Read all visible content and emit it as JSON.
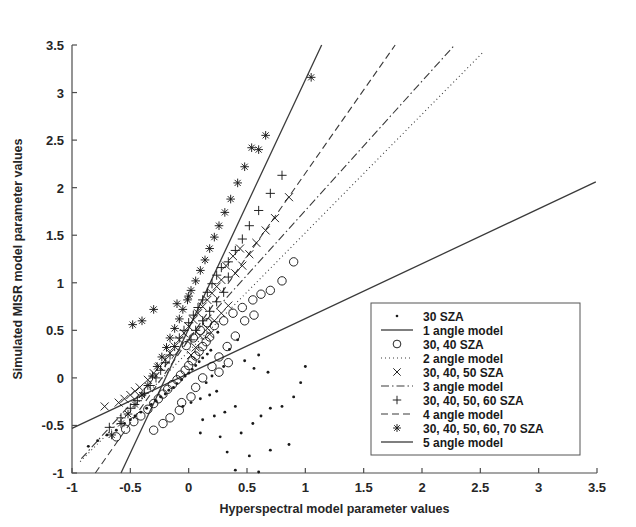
{
  "figure": {
    "kind": "scatter-plot",
    "background": "#ffffff",
    "ink_color": "#1a1a1a"
  },
  "chart_data": {
    "type": "scatter",
    "title": "",
    "xlabel": "Hyperspectral model parameter values",
    "ylabel": "Simulated MISR model parameter values",
    "xlim": [
      -1,
      3.5
    ],
    "ylim": [
      -1,
      3.5
    ],
    "xticks": [
      -1,
      -0.5,
      0,
      0.5,
      1,
      1.5,
      2,
      2.5,
      3,
      3.5
    ],
    "yticks": [
      -1,
      -0.5,
      0,
      0.5,
      1,
      1.5,
      2,
      2.5,
      3,
      3.5
    ],
    "xticklabels": [
      "-1",
      "-0.5",
      "0",
      "0.5",
      "1",
      "1.5",
      "2",
      "2.5",
      "3",
      "3.5"
    ],
    "yticklabels": [
      "-1",
      "-0.5",
      "0",
      "0.5",
      "1",
      "1.5",
      "2",
      "2.5",
      "3",
      "3.5"
    ],
    "grid": false,
    "legend_position": "lower right",
    "series": [
      {
        "name": "30 SZA",
        "marker": "dot",
        "points": [
          [
            -0.86,
            -0.72
          ],
          [
            -0.78,
            -0.66
          ],
          [
            -0.7,
            -0.6
          ],
          [
            -0.62,
            -0.55
          ],
          [
            -0.55,
            -0.48
          ],
          [
            -0.5,
            -0.44
          ],
          [
            -0.46,
            -0.4
          ],
          [
            -0.41,
            -0.36
          ],
          [
            -0.36,
            -0.32
          ],
          [
            -0.32,
            -0.28
          ],
          [
            -0.28,
            -0.24
          ],
          [
            -0.24,
            -0.2
          ],
          [
            -0.2,
            -0.17
          ],
          [
            -0.17,
            -0.13
          ],
          [
            -0.13,
            -0.1
          ],
          [
            -0.1,
            -0.06
          ],
          [
            -0.06,
            -0.02
          ],
          [
            -0.03,
            0.02
          ],
          [
            0.0,
            0.05
          ],
          [
            0.03,
            0.09
          ],
          [
            0.06,
            0.13
          ],
          [
            0.09,
            0.17
          ],
          [
            0.12,
            0.21
          ],
          [
            0.16,
            0.25
          ],
          [
            0.19,
            0.29
          ],
          [
            -0.05,
            -0.3
          ],
          [
            0.02,
            -0.26
          ],
          [
            0.1,
            -0.22
          ],
          [
            0.18,
            -0.18
          ],
          [
            0.24,
            -0.14
          ],
          [
            0.12,
            -0.44
          ],
          [
            0.22,
            -0.4
          ],
          [
            0.31,
            -0.36
          ],
          [
            0.4,
            -0.3
          ],
          [
            0.1,
            -0.58
          ],
          [
            0.27,
            -0.62
          ],
          [
            0.45,
            -0.58
          ],
          [
            0.55,
            -0.48
          ],
          [
            0.62,
            -0.4
          ],
          [
            0.7,
            -0.32
          ],
          [
            0.33,
            -0.78
          ],
          [
            0.52,
            -0.82
          ],
          [
            0.7,
            -0.76
          ],
          [
            0.86,
            -0.7
          ],
          [
            0.4,
            -0.97
          ],
          [
            0.6,
            -0.99
          ],
          [
            0.8,
            -0.3
          ],
          [
            0.9,
            -0.2
          ],
          [
            1.0,
            0.12
          ],
          [
            0.96,
            -0.05
          ],
          [
            0.48,
            0.18
          ],
          [
            0.56,
            0.1
          ],
          [
            0.35,
            0.3
          ],
          [
            0.42,
            0.4
          ],
          [
            0.25,
            0.48
          ],
          [
            0.3,
            0.12
          ],
          [
            0.2,
            0.02
          ],
          [
            0.15,
            -0.05
          ],
          [
            0.6,
            0.24
          ],
          [
            0.68,
            0.06
          ]
        ]
      },
      {
        "name": "30, 40 SZA",
        "marker": "circle",
        "points": [
          [
            -0.62,
            -0.62
          ],
          [
            -0.54,
            -0.54
          ],
          [
            -0.47,
            -0.46
          ],
          [
            -0.41,
            -0.4
          ],
          [
            -0.35,
            -0.33
          ],
          [
            -0.3,
            -0.27
          ],
          [
            -0.26,
            -0.22
          ],
          [
            -0.22,
            -0.17
          ],
          [
            -0.18,
            -0.12
          ],
          [
            -0.14,
            -0.07
          ],
          [
            -0.1,
            -0.02
          ],
          [
            -0.07,
            0.03
          ],
          [
            -0.03,
            0.08
          ],
          [
            0.0,
            0.13
          ],
          [
            0.03,
            0.18
          ],
          [
            0.06,
            0.23
          ],
          [
            0.09,
            0.28
          ],
          [
            0.12,
            0.33
          ],
          [
            0.15,
            0.38
          ],
          [
            0.18,
            0.43
          ],
          [
            -0.3,
            -0.55
          ],
          [
            -0.22,
            -0.48
          ],
          [
            -0.16,
            -0.42
          ],
          [
            -0.08,
            -0.34
          ],
          [
            0.06,
            -0.1
          ],
          [
            0.12,
            0.0
          ],
          [
            0.2,
            0.12
          ],
          [
            0.26,
            0.22
          ],
          [
            0.33,
            0.33
          ],
          [
            0.4,
            0.44
          ],
          [
            0.22,
            0.55
          ],
          [
            0.3,
            0.6
          ],
          [
            0.38,
            0.68
          ],
          [
            0.46,
            0.74
          ],
          [
            0.55,
            0.82
          ],
          [
            0.62,
            0.88
          ],
          [
            0.48,
            0.6
          ],
          [
            0.56,
            0.66
          ],
          [
            0.16,
            0.58
          ],
          [
            0.1,
            0.5
          ],
          [
            0.04,
            0.42
          ],
          [
            -0.02,
            0.34
          ],
          [
            0.7,
            0.92
          ],
          [
            0.8,
            1.02
          ],
          [
            0.9,
            1.22
          ],
          [
            0.34,
            0.16
          ],
          [
            0.26,
            0.06
          ],
          [
            0.02,
            -0.2
          ],
          [
            -0.06,
            -0.26
          ]
        ]
      },
      {
        "name": "30, 40, 50 SZA",
        "marker": "x",
        "points": [
          [
            -0.72,
            -0.3
          ],
          [
            -0.6,
            -0.26
          ],
          [
            -0.5,
            -0.18
          ],
          [
            -0.42,
            -0.1
          ],
          [
            -0.35,
            -0.02
          ],
          [
            -0.3,
            0.05
          ],
          [
            -0.25,
            0.12
          ],
          [
            -0.2,
            0.19
          ],
          [
            -0.16,
            0.26
          ],
          [
            -0.12,
            0.33
          ],
          [
            -0.08,
            0.4
          ],
          [
            -0.04,
            0.47
          ],
          [
            0.0,
            0.54
          ],
          [
            0.04,
            0.61
          ],
          [
            0.08,
            0.68
          ],
          [
            0.12,
            0.75
          ],
          [
            0.16,
            0.82
          ],
          [
            0.2,
            0.89
          ],
          [
            0.24,
            0.96
          ],
          [
            0.28,
            1.03
          ],
          [
            0.1,
            0.44
          ],
          [
            0.16,
            0.52
          ],
          [
            0.22,
            0.6
          ],
          [
            0.28,
            0.68
          ],
          [
            0.34,
            0.76
          ],
          [
            0.4,
            1.1
          ],
          [
            0.46,
            1.18
          ],
          [
            0.52,
            1.3
          ],
          [
            0.58,
            1.42
          ],
          [
            0.66,
            1.55
          ],
          [
            0.74,
            1.68
          ],
          [
            0.86,
            1.9
          ],
          [
            0.32,
            1.18
          ],
          [
            0.38,
            1.28
          ],
          [
            0.44,
            1.36
          ],
          [
            -0.55,
            -0.22
          ],
          [
            -0.46,
            -0.14
          ],
          [
            0.02,
            0.24
          ],
          [
            0.06,
            0.32
          ],
          [
            0.18,
            0.46
          ]
        ]
      },
      {
        "name": "30, 40, 50, 60 SZA",
        "marker": "plus",
        "points": [
          [
            -0.68,
            -0.52
          ],
          [
            -0.58,
            -0.42
          ],
          [
            -0.5,
            -0.32
          ],
          [
            -0.44,
            -0.24
          ],
          [
            -0.38,
            -0.16
          ],
          [
            -0.33,
            -0.08
          ],
          [
            -0.28,
            0.0
          ],
          [
            -0.24,
            0.08
          ],
          [
            -0.2,
            0.16
          ],
          [
            -0.16,
            0.24
          ],
          [
            -0.12,
            0.33
          ],
          [
            -0.08,
            0.42
          ],
          [
            -0.04,
            0.5
          ],
          [
            0.0,
            0.58
          ],
          [
            0.04,
            0.66
          ],
          [
            0.08,
            0.74
          ],
          [
            0.12,
            0.82
          ],
          [
            0.16,
            0.9
          ],
          [
            0.2,
            0.99
          ],
          [
            0.24,
            1.08
          ],
          [
            0.06,
            0.5
          ],
          [
            0.12,
            0.6
          ],
          [
            0.18,
            0.7
          ],
          [
            0.24,
            0.8
          ],
          [
            0.3,
            0.9
          ],
          [
            0.34,
            1.22
          ],
          [
            0.4,
            1.34
          ],
          [
            0.46,
            1.46
          ],
          [
            0.52,
            1.6
          ],
          [
            0.6,
            1.76
          ],
          [
            0.7,
            1.94
          ],
          [
            0.8,
            2.13
          ],
          [
            0.28,
            1.16
          ],
          [
            0.34,
            1.06
          ],
          [
            0.02,
            0.4
          ]
        ]
      },
      {
        "name": "30, 40, 50, 60, 70 SZA",
        "marker": "asterisk",
        "points": [
          [
            -0.66,
            -0.6
          ],
          [
            -0.58,
            -0.48
          ],
          [
            -0.52,
            -0.38
          ],
          [
            -0.46,
            -0.28
          ],
          [
            -0.4,
            -0.18
          ],
          [
            -0.35,
            -0.08
          ],
          [
            -0.31,
            0.02
          ],
          [
            -0.27,
            0.12
          ],
          [
            -0.23,
            0.22
          ],
          [
            -0.19,
            0.32
          ],
          [
            -0.16,
            0.42
          ],
          [
            -0.12,
            0.52
          ],
          [
            -0.08,
            0.62
          ],
          [
            -0.05,
            0.72
          ],
          [
            -0.01,
            0.82
          ],
          [
            0.02,
            0.92
          ],
          [
            0.06,
            1.02
          ],
          [
            0.1,
            1.13
          ],
          [
            0.14,
            1.24
          ],
          [
            0.18,
            1.36
          ],
          [
            -0.48,
            0.56
          ],
          [
            -0.4,
            0.6
          ],
          [
            -0.3,
            0.72
          ],
          [
            0.22,
            1.48
          ],
          [
            0.26,
            1.6
          ],
          [
            0.31,
            1.74
          ],
          [
            0.36,
            1.88
          ],
          [
            0.42,
            2.05
          ],
          [
            0.48,
            2.22
          ],
          [
            0.54,
            2.42
          ],
          [
            0.6,
            2.4
          ],
          [
            0.66,
            2.55
          ],
          [
            1.05,
            3.16
          ],
          [
            0.0,
            0.86
          ],
          [
            -0.1,
            0.78
          ]
        ]
      }
    ],
    "model_lines": [
      {
        "name": "1 angle model",
        "style": "solid",
        "x0": -0.58,
        "y0": -1.0,
        "x1": 1.14,
        "y1": 3.5
      },
      {
        "name": "2 angle model",
        "style": "dotted",
        "x0": -0.93,
        "y0": -0.88,
        "x1": 2.52,
        "y1": 3.42
      },
      {
        "name": "3 angle model",
        "style": "dashdot",
        "x0": -0.92,
        "y0": -0.85,
        "x1": 2.28,
        "y1": 3.5
      },
      {
        "name": "4 angle model",
        "style": "dashed",
        "x0": -0.8,
        "y0": -1.0,
        "x1": 1.77,
        "y1": 3.5
      },
      {
        "name": "5 angle model",
        "style": "solid",
        "x0": -1.0,
        "y0": -0.53,
        "x1": 3.49,
        "y1": 2.06
      }
    ]
  },
  "legend": {
    "entries": [
      {
        "label": "30 SZA",
        "kind": "marker",
        "marker": "dot"
      },
      {
        "label": "1 angle model",
        "kind": "line",
        "style": "solid"
      },
      {
        "label": "30, 40 SZA",
        "kind": "marker",
        "marker": "circle"
      },
      {
        "label": "2 angle model",
        "kind": "line",
        "style": "dotted"
      },
      {
        "label": "30, 40, 50 SZA",
        "kind": "marker",
        "marker": "x"
      },
      {
        "label": "3 angle model",
        "kind": "line",
        "style": "dashdot"
      },
      {
        "label": "30, 40, 50, 60 SZA",
        "kind": "marker",
        "marker": "plus"
      },
      {
        "label": "4 angle model",
        "kind": "line",
        "style": "dashed"
      },
      {
        "label": "30, 40, 50, 60, 70 SZA",
        "kind": "marker",
        "marker": "asterisk"
      },
      {
        "label": "5 angle model",
        "kind": "line",
        "style": "solid"
      }
    ]
  }
}
